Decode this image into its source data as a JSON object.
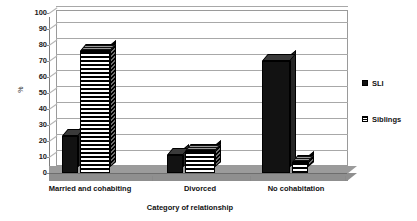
{
  "chart_data": {
    "type": "bar",
    "title": "",
    "subtitle": "",
    "xlabel": "Category of relationship",
    "ylabel": "%",
    "categories": [
      "Married and cohabiting",
      "Divorced",
      "No cohabitation"
    ],
    "series": [
      {
        "name": "SLI",
        "values": [
          23,
          11,
          70
        ],
        "color": "#121212",
        "fill": "solid-black"
      },
      {
        "name": "Siblings",
        "values": [
          76,
          14,
          7
        ],
        "color": "#000000",
        "fill": "horizontal-stripes"
      }
    ],
    "ylim": [
      0,
      100
    ],
    "ytick_step": 10,
    "yticks": [
      0,
      10,
      20,
      30,
      40,
      50,
      60,
      70,
      80,
      90,
      100
    ],
    "ytick_labels": [
      "0",
      "10",
      "20",
      "30",
      "40",
      "50",
      "60",
      "70",
      "80",
      "90",
      "100"
    ],
    "grid": true,
    "grid_axis": "y",
    "legend_position": "right",
    "style": "3d-column"
  },
  "legend": {
    "entries": [
      {
        "label": "SLI",
        "swatch": "solid-black-square"
      },
      {
        "label": "Siblings",
        "swatch": "striped-square"
      }
    ]
  },
  "axes": {
    "y_title": "%",
    "x_title": "Category of relationship"
  }
}
